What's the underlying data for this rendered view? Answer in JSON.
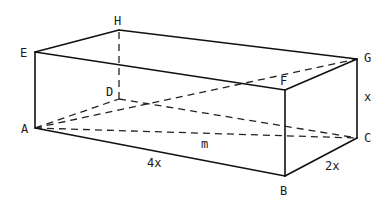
{
  "diagram": {
    "type": "rectangular-prism",
    "vertices": {
      "A": {
        "label": "A",
        "x": 35,
        "y": 128
      },
      "B": {
        "label": "B",
        "x": 285,
        "y": 176
      },
      "C": {
        "label": "C",
        "x": 357,
        "y": 138
      },
      "D": {
        "label": "D",
        "x": 119,
        "y": 99
      },
      "E": {
        "label": "E",
        "x": 35,
        "y": 52
      },
      "F": {
        "label": "F",
        "x": 285,
        "y": 90
      },
      "G": {
        "label": "G",
        "x": 357,
        "y": 59
      },
      "H": {
        "label": "H",
        "x": 119,
        "y": 30
      }
    },
    "solid_edges": [
      "A-B",
      "B-C",
      "C-G",
      "G-F",
      "F-B",
      "A-E",
      "E-F",
      "E-H",
      "H-G"
    ],
    "dashed_edges": [
      "D-H",
      "A-D",
      "D-C",
      "A-C",
      "A-G"
    ],
    "dimension_labels": {
      "length": "4x",
      "width": "2x",
      "height": "x",
      "diagonal": "m"
    },
    "colors": {
      "line": "#111111",
      "background": "#ffffff"
    }
  }
}
